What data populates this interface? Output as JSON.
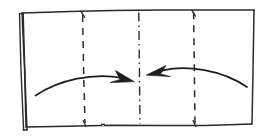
{
  "diagram": {
    "title": "Origami fold step diagram",
    "style": {
      "ink_color": "#2b2b2b",
      "background_color": "#ffffff",
      "stroke_width": 1.4,
      "sketch_look": "hand-drawn"
    },
    "paper_sheet": {
      "label": "paper-sheet",
      "outline_points": "22,13 254,10 252,124 26,127",
      "top_edge": "22,13 90,11.5 140,10.2 196,10.0 254,10",
      "bottom_edge": "26,127 85,126 140,125 196,125.5 252,124",
      "left_edge": "22,13 26,127",
      "right_edge": "254,10 252,124"
    },
    "flap": {
      "label": "left-folded-flap",
      "description": "narrow sliver of paper folded back along the left edge",
      "outer_edge": "19,14 24,130",
      "inner_edge": "23,14 27,130",
      "bottom_edge": "19,130 27,130"
    },
    "fold_lines": [
      {
        "id": "fold-line-left",
        "label": "left dashed fold line",
        "type": "dashed",
        "x_top": 83,
        "y_top": 15,
        "x_bottom": 85,
        "y_bottom": 124,
        "dash_pattern": "7 6"
      },
      {
        "id": "center-line",
        "label": "dash-dot center line",
        "type": "dash-dot",
        "x_top": 139,
        "y_top": 13,
        "x_bottom": 140,
        "y_bottom": 124,
        "dash_pattern": "9 4 1.5 4"
      },
      {
        "id": "fold-line-right",
        "label": "right dashed fold line",
        "type": "dashed",
        "x_top": 194,
        "y_top": 13,
        "x_bottom": 195,
        "y_bottom": 124,
        "dash_pattern": "7 6"
      }
    ],
    "arrows": [
      {
        "id": "arrow-left",
        "label": "left curved fold arrow",
        "direction": "right",
        "points_to": "center-line",
        "path": "M 36,95 C 62,80 95,73 124,78",
        "head_points": "133,80 118,73 121,82 113,85"
      },
      {
        "id": "arrow-right",
        "label": "right curved fold arrow",
        "direction": "left",
        "points_to": "center-line",
        "path": "M 246,86 C 222,71 187,64 158,72",
        "head_points": "148,75 164,67 160,76 168,79"
      }
    ],
    "tick_marks": [
      {
        "id": "tick-top-left-fold",
        "x1": 81,
        "y1": 11,
        "x2": 85,
        "y2": 17
      },
      {
        "id": "tick-top-right-fold",
        "x1": 192,
        "y1": 10,
        "x2": 196,
        "y2": 16
      },
      {
        "id": "tick-bottom-left-fold",
        "x1": 83,
        "y1": 121,
        "x2": 86,
        "y2": 127
      },
      {
        "id": "tick-bottom-right-fold",
        "x1": 193,
        "y1": 121,
        "x2": 196,
        "y2": 127
      }
    ]
  }
}
